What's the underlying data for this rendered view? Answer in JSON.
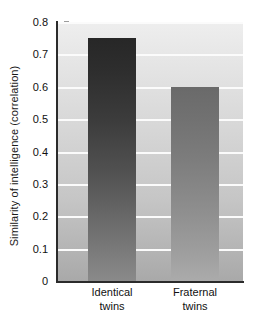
{
  "chart_data": {
    "type": "bar",
    "title": "",
    "xlabel": "",
    "ylabel": "Similarity of intelligence (correlation)",
    "categories": [
      "Identical twins",
      "Fraternal twins"
    ],
    "category_lines": [
      [
        "Identical",
        "twins"
      ],
      [
        "Fraternal",
        "twins"
      ]
    ],
    "values": [
      0.75,
      0.6
    ],
    "ylim": [
      0,
      0.8
    ],
    "yticks": [
      0,
      0.1,
      0.2,
      0.3,
      0.4,
      0.5,
      0.6,
      0.7,
      0.8
    ],
    "ytick_labels": [
      "0",
      "0.1",
      "0.2",
      "0.3",
      "0.4",
      "0.5",
      "0.6",
      "0.7",
      "0.8"
    ],
    "grid": true,
    "gridline_color": "#fbfbfb",
    "legend": "none",
    "bar_colors": [
      "#2e2e2e",
      "#7d7d7d"
    ],
    "plot_background": "#d6d6d6",
    "axis_color": "#2b2b2b",
    "text_color": "#111111"
  }
}
